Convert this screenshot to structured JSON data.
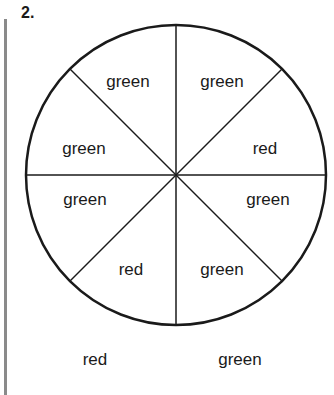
{
  "problem": {
    "number": "2."
  },
  "spinner": {
    "sections": [
      {
        "position": "top-right-upper",
        "label": "green"
      },
      {
        "position": "top-right-lower",
        "label": "red"
      },
      {
        "position": "bottom-right-upper",
        "label": "green"
      },
      {
        "position": "bottom-right-lower",
        "label": "green"
      },
      {
        "position": "bottom-left-lower",
        "label": "red"
      },
      {
        "position": "bottom-left-upper",
        "label": "green"
      },
      {
        "position": "top-left-lower",
        "label": "green"
      },
      {
        "position": "top-left-upper",
        "label": "green"
      }
    ]
  },
  "answer_choices": [
    {
      "label": "red"
    },
    {
      "label": "green"
    }
  ]
}
